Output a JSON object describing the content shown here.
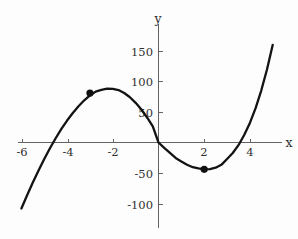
{
  "chart_data": {
    "type": "line",
    "title": "",
    "subtitle": "",
    "xlabel": "x",
    "ylabel": "y",
    "function_label": "y = 2x^3 + 3x^2 - 36x",
    "xlim": [
      -6.4,
      5.2
    ],
    "ylim": [
      -135,
      175
    ],
    "grid": false,
    "legend": null,
    "axis_style": "centered-cross",
    "x_ticks": [
      -6,
      -4,
      -2,
      2,
      4
    ],
    "x_tick_labels": [
      "-6",
      "-4",
      "-2",
      "2",
      "4"
    ],
    "y_ticks": [
      -100,
      -50,
      50,
      100,
      150
    ],
    "y_tick_labels": [
      "-100",
      "-50",
      "50",
      "100",
      "150"
    ],
    "series": [
      {
        "name": "cubic",
        "color": "#131313",
        "x": [
          -6.0,
          -5.75,
          -5.5,
          -5.25,
          -5.0,
          -4.75,
          -4.5,
          -4.25,
          -4.0,
          -3.75,
          -3.5,
          -3.25,
          -3.0,
          -2.75,
          -2.5,
          -2.25,
          -2.0,
          -1.75,
          -1.5,
          -1.25,
          -1.0,
          -0.75,
          -0.5,
          -0.25,
          0.0,
          0.25,
          0.5,
          0.75,
          1.0,
          1.25,
          1.5,
          1.75,
          2.0,
          2.25,
          2.5,
          2.75,
          3.0,
          3.25,
          3.5,
          3.75,
          4.0,
          4.25,
          4.5,
          4.75,
          5.0
        ],
        "y": [
          -108.0,
          -86.3,
          -65.5,
          -45.8,
          -27.0,
          -9.4,
          7.0,
          22.2,
          36.0,
          48.4,
          59.5,
          69.1,
          77.0,
          83.4,
          86.3,
          88.3,
          88.0,
          85.9,
          81.0,
          74.2,
          65.0,
          54.0,
          41.0,
          26.3,
          0.0,
          -8.8,
          -17.0,
          -25.3,
          -31.0,
          -36.4,
          -40.5,
          -42.5,
          -44.0,
          -43.6,
          -41.3,
          -36.6,
          -27.0,
          -17.2,
          -4.4,
          12.2,
          32.0,
          56.2,
          85.5,
          120.1,
          160.0
        ]
      }
    ],
    "marked_points": [
      {
        "label": "local-maximum",
        "x": -3,
        "y": 81
      },
      {
        "label": "local-minimum",
        "x": 2,
        "y": -44
      }
    ]
  }
}
